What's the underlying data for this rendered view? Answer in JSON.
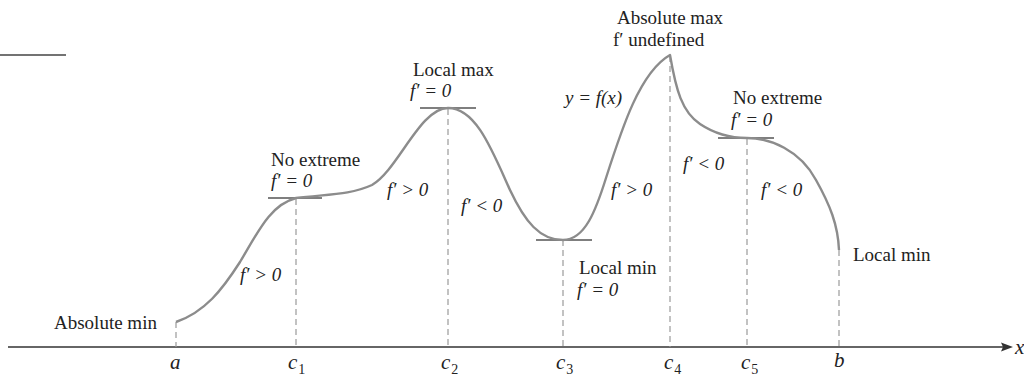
{
  "diagram": {
    "title": "",
    "colors": {
      "curve": "#8c8c8c",
      "axis": "#333333",
      "text": "#222222",
      "dash": "#999999",
      "tangent": "#555555"
    },
    "curve_label": "y = f(x)",
    "axis": {
      "label": "x"
    },
    "ticks": [
      {
        "id": "a",
        "base": "a",
        "sub": ""
      },
      {
        "id": "c1",
        "base": "c",
        "sub": "1"
      },
      {
        "id": "c2",
        "base": "c",
        "sub": "2"
      },
      {
        "id": "c3",
        "base": "c",
        "sub": "3"
      },
      {
        "id": "c4",
        "base": "c",
        "sub": "4"
      },
      {
        "id": "c5",
        "base": "c",
        "sub": "5"
      },
      {
        "id": "b",
        "base": "b",
        "sub": ""
      }
    ],
    "annotations": {
      "a": {
        "line1": "Absolute min"
      },
      "c1": {
        "line1": "No extreme",
        "line2": "f′ = 0"
      },
      "c2": {
        "line1": "Local max",
        "line2": "f′ = 0"
      },
      "c3": {
        "line1": "Local min",
        "line2": "f′ = 0"
      },
      "c4": {
        "line1": "Absolute max",
        "line2": "f′ undefined"
      },
      "c5": {
        "line1": "No extreme",
        "line2": "f′ = 0"
      },
      "b": {
        "line1": "Local min"
      }
    },
    "slopes": {
      "a_c1": "f′ > 0",
      "c1_c2": "f′ > 0",
      "c2_c3": "f′ < 0",
      "c3_c4": "f′ > 0",
      "c4_c5": "f′ < 0",
      "c5_b": "f′ < 0"
    }
  }
}
